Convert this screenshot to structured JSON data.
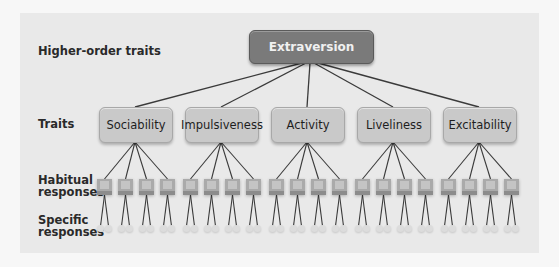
{
  "labels": {
    "higher_order": "Higher-order traits",
    "traits": "Traits",
    "habitual_line1": "Habitual",
    "habitual_line2": "responses",
    "specific_line1": "Specific",
    "specific_line2": "responses"
  },
  "top": {
    "label": "Extraversion"
  },
  "traits": [
    {
      "label": "Sociability"
    },
    {
      "label": "Impulsiveness"
    },
    {
      "label": "Activity"
    },
    {
      "label": "Liveliness"
    },
    {
      "label": "Excitability"
    }
  ],
  "structure": {
    "habitual_per_trait": 4,
    "specific_per_habitual": 2
  },
  "colors": {
    "background": "#f7f7f7",
    "panel": "#e9e9e9",
    "top_box": "#7a7a7a",
    "trait_box": "#c9c9c9",
    "lines": "#3a3a3a"
  }
}
